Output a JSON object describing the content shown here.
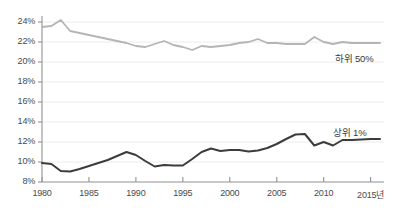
{
  "chart_data": {
    "type": "line",
    "title": "",
    "subtitle": "",
    "xlabel": "",
    "ylabel": "",
    "xlim": [
      1980,
      2016
    ],
    "ylim": [
      8,
      24
    ],
    "grid": true,
    "grid_axis": "y",
    "legend_position": "inline-right",
    "x": [
      1980,
      1981,
      1982,
      1983,
      1984,
      1985,
      1986,
      1987,
      1988,
      1989,
      1990,
      1991,
      1992,
      1993,
      1994,
      1995,
      1996,
      1997,
      1998,
      1999,
      2000,
      2001,
      2002,
      2003,
      2004,
      2005,
      2006,
      2007,
      2008,
      2009,
      2010,
      2011,
      2012,
      2013,
      2014,
      2015,
      2016
    ],
    "xticks": [
      1980,
      1985,
      1990,
      1995,
      2000,
      2005,
      2010,
      2015
    ],
    "xtick_labels": [
      "1980",
      "1985",
      "1990",
      "1995",
      "2000",
      "2005",
      "2010",
      "2015년"
    ],
    "yticks": [
      8,
      10,
      12,
      14,
      16,
      18,
      20,
      22,
      24
    ],
    "ytick_labels": [
      "8%",
      "10%",
      "12%",
      "14%",
      "16%",
      "18%",
      "20%",
      "22%",
      "24%"
    ],
    "series": [
      {
        "name": "하위 50%",
        "color": "#b5b5b5",
        "label_x": 2011.2,
        "label_y": 20.5,
        "values": [
          23.5,
          23.6,
          24.2,
          23.1,
          22.9,
          22.7,
          22.5,
          22.3,
          22.1,
          21.9,
          21.6,
          21.5,
          21.8,
          22.1,
          21.7,
          21.5,
          21.2,
          21.6,
          21.5,
          21.6,
          21.7,
          21.9,
          22.0,
          22.3,
          21.9,
          21.9,
          21.8,
          21.8,
          21.8,
          22.5,
          22.0,
          21.8,
          22.0,
          21.9,
          21.9,
          21.9,
          21.9
        ]
      },
      {
        "name": "상위 1%",
        "color": "#3c3c3c",
        "label_x": 2011.0,
        "label_y": 13.1,
        "values": [
          9.9,
          9.8,
          9.1,
          9.05,
          9.3,
          9.6,
          9.9,
          10.2,
          10.6,
          11.0,
          10.7,
          10.1,
          9.55,
          9.7,
          9.65,
          9.65,
          10.3,
          11.0,
          11.35,
          11.1,
          11.2,
          11.2,
          11.05,
          11.15,
          11.4,
          11.8,
          12.3,
          12.75,
          12.8,
          11.65,
          12.0,
          11.65,
          12.2,
          12.2,
          12.25,
          12.3,
          12.3
        ]
      }
    ]
  }
}
